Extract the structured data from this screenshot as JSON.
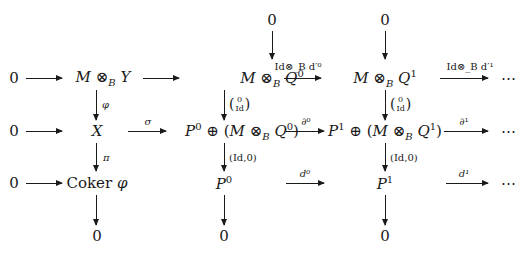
{
  "diagram": {
    "rows": [
      {
        "nodes": [
          {
            "id": "r1_zero",
            "text": "0"
          },
          {
            "id": "r1_MY",
            "text": "M ⊗_B Y"
          },
          {
            "id": "r1_MQ0",
            "text": "M ⊗_B Q⁰"
          },
          {
            "id": "r1_MQ1",
            "text": "M ⊗_B Q¹"
          },
          {
            "id": "r1_dots",
            "text": "⋯"
          }
        ],
        "arrows": [
          {
            "from": "r1_zero",
            "to": "r1_MY",
            "label": ""
          },
          {
            "from": "r1_MY",
            "to": "r1_MQ0",
            "label": ""
          },
          {
            "from": "r1_MQ0",
            "to": "r1_MQ1",
            "label": "Id⊗_B d′⁰"
          },
          {
            "from": "r1_MQ1",
            "to": "r1_dots",
            "label": "Id⊗_B d′¹"
          }
        ]
      },
      {
        "nodes": [
          {
            "id": "r2_zero",
            "text": "0"
          },
          {
            "id": "r2_X",
            "text": "X"
          },
          {
            "id": "r2_P0sum",
            "text": "P⁰ ⊕ (M ⊗_B Q⁰)"
          },
          {
            "id": "r2_P1sum",
            "text": "P¹ ⊕ (M ⊗_B Q¹)"
          },
          {
            "id": "r2_dots",
            "text": "⋯"
          }
        ],
        "arrows": [
          {
            "from": "r2_zero",
            "to": "r2_X",
            "label": ""
          },
          {
            "from": "r2_X",
            "to": "r2_P0sum",
            "label": "σ"
          },
          {
            "from": "r2_P0sum",
            "to": "r2_P1sum",
            "label": "∂⁰"
          },
          {
            "from": "r2_P1sum",
            "to": "r2_dots",
            "label": "∂¹"
          }
        ]
      },
      {
        "nodes": [
          {
            "id": "r3_zero",
            "text": "0"
          },
          {
            "id": "r3_coker",
            "text": "Coker φ"
          },
          {
            "id": "r3_P0",
            "text": "P⁰"
          },
          {
            "id": "r3_P1",
            "text": "P¹"
          },
          {
            "id": "r3_dots",
            "text": "⋯"
          }
        ],
        "arrows": [
          {
            "from": "r3_zero",
            "to": "r3_coker",
            "label": ""
          },
          {
            "from": "r3_P0",
            "to": "r3_P1",
            "label": "d⁰"
          },
          {
            "from": "r3_P1",
            "to": "r3_dots",
            "label": "d¹"
          }
        ]
      }
    ],
    "top_zeros": [
      "0",
      "0"
    ],
    "bottom_zeros": [
      "0",
      "0",
      "0"
    ],
    "vertical_labels": {
      "phi": "φ",
      "pi": "π",
      "inclusion_top": "0",
      "inclusion_bottom": "Id",
      "projection": "(Id,0)"
    },
    "labels": {
      "zero": "0",
      "M": "M",
      "otimes_B": "⊗",
      "B": "B",
      "Y": "Y",
      "Q": "Q",
      "P": "P",
      "X": "X",
      "oplus": "⊕",
      "sup0": "0",
      "sup1": "1",
      "coker": "Coker",
      "phi": "φ",
      "dots": "⋯",
      "sigma": "σ",
      "partial0": "∂⁰",
      "partial1": "∂¹",
      "d0": "d⁰",
      "d1": "d¹",
      "Id_otimes_d0": "Id⊗",
      "Id_otimes_d1": "Id⊗",
      "dprime0": "d′⁰",
      "dprime1": "d′¹",
      "lparen": "(",
      "rparen": ")"
    }
  }
}
